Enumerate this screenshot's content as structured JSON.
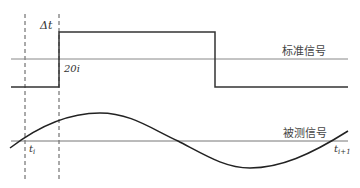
{
  "diagram": {
    "labels": {
      "delta_t": "Δt",
      "twenty_i": "20i",
      "reference_signal": "标准信号",
      "measured_signal": "被测信号",
      "t_i": "t",
      "t_i_sub": "i",
      "t_i1": "t",
      "t_i1_sub": "i+1"
    },
    "colors": {
      "square_wave": "#333333",
      "axis": "#777777",
      "sine": "#222222",
      "dashed": "#555555"
    }
  }
}
